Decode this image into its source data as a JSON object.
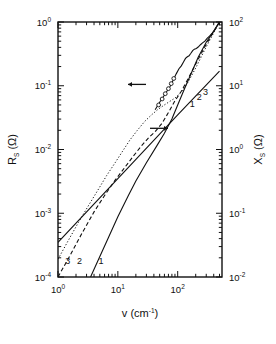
{
  "figure": {
    "background": "#ffffff",
    "ink": "#111111"
  },
  "axes": {
    "x": {
      "label_var": "v",
      "label_unit": "(cm",
      "label_unit_sup": "-1",
      "label_unit_close": ")",
      "label_full": "v (cm-1)",
      "scale": "log",
      "min": 1,
      "max": 550,
      "decade_ticks": [
        1,
        10,
        100
      ],
      "decade_tick_labels": [
        "10",
        "10",
        "10"
      ],
      "decade_tick_exponents": [
        "0",
        "1",
        "2"
      ]
    },
    "y_left": {
      "label_var": "R",
      "label_sub": "S",
      "label_unit": " (Ω)",
      "label_full": "RS (Ω)",
      "scale": "log",
      "min": 0.0001,
      "max": 1,
      "decade_ticks": [
        0.0001,
        0.001,
        0.01,
        0.1,
        1
      ],
      "decade_tick_labels": [
        "10",
        "10",
        "10",
        "10",
        "10"
      ],
      "decade_tick_exponents": [
        "-4",
        "-3",
        "-2",
        "-1",
        "0"
      ]
    },
    "y_right": {
      "label_var": "X",
      "label_sub": "S",
      "label_unit": " (Ω)",
      "label_full": "XS (Ω)",
      "scale": "log",
      "min": 0.01,
      "max": 100,
      "decade_ticks": [
        0.01,
        0.1,
        1,
        10,
        100
      ],
      "decade_tick_labels": [
        "10",
        "10",
        "10",
        "10",
        "10"
      ],
      "decade_tick_exponents": [
        "-2",
        "-1",
        "0",
        "1",
        "2"
      ]
    }
  },
  "annotations": {
    "arrow_left": "←",
    "arrow_right": "→",
    "arrow_left_name": "points-to-left-axis",
    "arrow_right_name": "points-to-right-axis",
    "rs_curve_labels": [
      "3",
      "2",
      "1"
    ],
    "xs_curve_labels": [
      "1",
      "2",
      "3"
    ]
  },
  "chart_data": {
    "type": "line",
    "title": "",
    "xlabel": "v (cm-1)",
    "ylabel": "RS (Ω)",
    "ylabel_right": "XS (Ω)",
    "xscale": "log",
    "yscale": "log",
    "xlim": [
      1,
      550
    ],
    "ylim_left": [
      0.0001,
      1
    ],
    "ylim_right": [
      0.01,
      100
    ],
    "grid": false,
    "legend": "none",
    "series": [
      {
        "name": "1",
        "axis": "left",
        "style": "solid",
        "comment": "R_S model curve 1, steep slope ~2 at low v",
        "x": [
          3.5,
          5,
          7,
          10,
          15,
          20,
          30,
          45,
          60,
          80,
          100,
          130,
          170,
          220,
          300,
          400,
          500
        ],
        "y": [
          0.0001,
          0.00021,
          0.00042,
          0.00088,
          0.0019,
          0.0032,
          0.0062,
          0.0115,
          0.018,
          0.03,
          0.05,
          0.09,
          0.16,
          0.28,
          0.48,
          0.72,
          1.0
        ]
      },
      {
        "name": "2",
        "axis": "left",
        "style": "dashed",
        "comment": "R_S model curve 2, with plateau near v=20-40",
        "x": [
          1.0,
          1.6,
          2.5,
          4,
          6,
          9,
          13,
          18,
          25,
          33,
          42,
          55,
          70,
          90,
          115,
          150,
          200,
          280,
          380,
          500
        ],
        "y": [
          0.0001,
          0.00022,
          0.00048,
          0.00105,
          0.0019,
          0.0033,
          0.0052,
          0.0078,
          0.0115,
          0.0155,
          0.019,
          0.026,
          0.038,
          0.058,
          0.082,
          0.13,
          0.22,
          0.4,
          0.65,
          1.0
        ]
      },
      {
        "name": "3",
        "axis": "left",
        "style": "dotted",
        "comment": "R_S model curve 3, rises fastest at low v then flattens near 0.06",
        "x": [
          1.0,
          1.5,
          2.2,
          3.2,
          4.5,
          6.5,
          9,
          12,
          16,
          21,
          28,
          36,
          46,
          58,
          72,
          90,
          115,
          150,
          200,
          280,
          380,
          500
        ],
        "y": [
          0.00019,
          0.00038,
          0.00072,
          0.0013,
          0.0022,
          0.0039,
          0.0062,
          0.0094,
          0.0142,
          0.0198,
          0.0275,
          0.0345,
          0.042,
          0.049,
          0.056,
          0.064,
          0.08,
          0.115,
          0.19,
          0.36,
          0.62,
          1.0
        ]
      },
      {
        "name": "experimental",
        "axis": "left",
        "style": "noisy-solid",
        "comment": "measured R_S data with open-circle markers and wiggles above 100",
        "x": [
          42,
          50,
          58,
          66,
          75,
          85,
          95,
          105,
          115,
          125,
          135,
          145,
          155,
          165,
          178,
          190,
          205,
          220,
          240,
          260,
          285,
          310,
          340,
          375,
          410,
          450,
          500
        ],
        "y": [
          0.042,
          0.055,
          0.068,
          0.082,
          0.098,
          0.125,
          0.155,
          0.185,
          0.205,
          0.235,
          0.268,
          0.285,
          0.295,
          0.32,
          0.355,
          0.375,
          0.385,
          0.405,
          0.44,
          0.47,
          0.5,
          0.555,
          0.6,
          0.66,
          0.74,
          0.86,
          1.0
        ],
        "markers_x": [
          48,
          55,
          62,
          70,
          78,
          86
        ],
        "markers_y": [
          0.05,
          0.062,
          0.075,
          0.09,
          0.108,
          0.13
        ]
      },
      {
        "name": "XS-line",
        "axis": "right",
        "style": "solid",
        "comment": "X_S straight line, slope 1 on log-log, spans full width; labels 1,2,3 nearly coincide",
        "x": [
          1.0,
          10,
          100,
          500
        ],
        "y_right": [
          0.035,
          0.35,
          3.5,
          17.0
        ]
      }
    ],
    "annotations": [
      {
        "text": "←",
        "x": 52,
        "y_left": 0.105,
        "meaning": "left-axis arrow"
      },
      {
        "text": "→",
        "x": 150,
        "y_left": 0.022,
        "meaning": "right-axis arrow"
      },
      {
        "text": "3",
        "x": 1.45,
        "y_left": 0.00016
      },
      {
        "text": "2",
        "x": 2.3,
        "y_left": 0.00016
      },
      {
        "text": "1",
        "x": 5.2,
        "y_left": 0.00016
      },
      {
        "text": "1",
        "x": 175,
        "y_left": 0.047
      },
      {
        "text": "2",
        "x": 230,
        "y_left": 0.06
      },
      {
        "text": "3",
        "x": 290,
        "y_left": 0.072
      }
    ]
  }
}
